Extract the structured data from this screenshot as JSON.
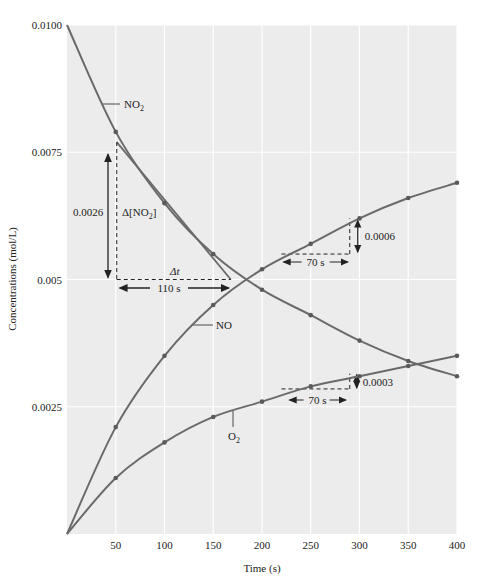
{
  "chart_data": {
    "type": "line",
    "title": "",
    "xlabel": "Time (s)",
    "ylabel": "Concentrations (mol/L)",
    "xlim": [
      0,
      400
    ],
    "ylim": [
      0,
      0.01
    ],
    "x_ticks": [
      50,
      100,
      150,
      200,
      250,
      300,
      350,
      400
    ],
    "y_ticks": [
      "0.0025",
      "0.005",
      "0.0075",
      "0.0100"
    ],
    "y_tick_values": [
      0.0025,
      0.005,
      0.0075,
      0.01
    ],
    "grid": true,
    "x": [
      0,
      50,
      100,
      150,
      200,
      250,
      300,
      350,
      400
    ],
    "series": [
      {
        "name": "NO2",
        "label": "NO",
        "sub": "2",
        "values": [
          0.01,
          0.0079,
          0.0065,
          0.0055,
          0.0048,
          0.0043,
          0.0038,
          0.0034,
          0.0031
        ]
      },
      {
        "name": "NO",
        "label": "NO",
        "sub": "",
        "values": [
          0,
          0.0021,
          0.0035,
          0.0045,
          0.0052,
          0.0057,
          0.0062,
          0.0066,
          0.0069
        ]
      },
      {
        "name": "O2",
        "label": "O",
        "sub": "2",
        "values": [
          0,
          0.0011,
          0.0018,
          0.0023,
          0.0026,
          0.0029,
          0.0031,
          0.0033,
          0.0035
        ]
      }
    ],
    "annotations": {
      "tangent": {
        "delta_y_label": "0.0026",
        "delta_conc_label": "Δ[NO",
        "delta_conc_sub": "2",
        "delta_conc_close": "]",
        "delta_t_label": "Δt",
        "delta_t_value": "110 s"
      },
      "no_rate": {
        "dy": "0.0006",
        "dt": "70 s"
      },
      "o2_rate": {
        "dy": "0.0003",
        "dt": "70 s"
      }
    }
  },
  "colors": {
    "plot_bg": "#ececec",
    "grid": "#ffffff",
    "curve": "#6a6a6a",
    "marker": "#5a5a5a",
    "annotation": "#222222"
  }
}
